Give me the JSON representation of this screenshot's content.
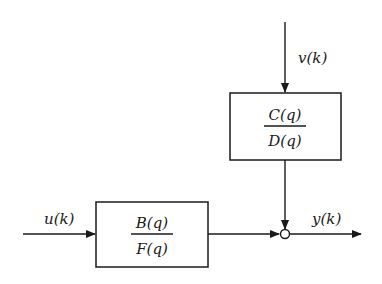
{
  "diagram": {
    "type": "block-diagram",
    "blocks": [
      {
        "id": "plant",
        "numerator": "B(q)",
        "denominator": "F(q)"
      },
      {
        "id": "noise-model",
        "numerator": "C(q)",
        "denominator": "D(q)"
      }
    ],
    "signals": {
      "input": "u(k)",
      "noise": "v(k)",
      "output": "y(k)"
    },
    "junction": "sum"
  }
}
